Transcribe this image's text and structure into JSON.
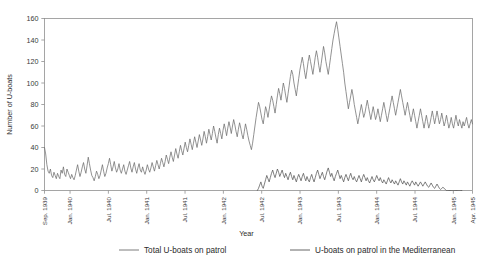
{
  "chart_data": {
    "type": "line",
    "title": "",
    "xlabel": "Year",
    "ylabel": "Number of U-boats",
    "ylim": [
      0,
      160
    ],
    "ytick_values": [
      0,
      20,
      40,
      60,
      80,
      100,
      120,
      140,
      160
    ],
    "grid": false,
    "legend_position": "bottom",
    "xtick_labels": [
      "Sep. 1939",
      "Jan. 1940",
      "Jul. 1940",
      "Jan. 1941",
      "Jul. 1941",
      "Jan. 1942",
      "Jul. 1942",
      "Jan. 1943",
      "Jul. 1943",
      "Jan. 1944",
      "Jul. 1944",
      "Jan. 1945",
      "Apr. 1945"
    ],
    "xtick_months": [
      0,
      4,
      10,
      16,
      22,
      28,
      34,
      40,
      46,
      52,
      58,
      64,
      67
    ],
    "x_start_label": "Sep. 1939",
    "x_end_label": "Apr. 1945",
    "series": [
      {
        "name": "Total U-boats on patrol",
        "color": "#6e6e6e",
        "values": [
          40,
          34,
          24,
          18,
          16,
          20,
          14,
          12,
          17,
          14,
          11,
          16,
          13,
          11,
          19,
          16,
          22,
          15,
          13,
          20,
          17,
          14,
          11,
          15,
          12,
          10,
          14,
          19,
          24,
          18,
          13,
          17,
          22,
          26,
          20,
          16,
          23,
          31,
          25,
          19,
          14,
          12,
          9,
          13,
          18,
          15,
          11,
          14,
          19,
          24,
          18,
          13,
          16,
          21,
          25,
          30,
          24,
          18,
          22,
          27,
          21,
          17,
          20,
          25,
          19,
          16,
          20,
          24,
          18,
          15,
          19,
          23,
          27,
          21,
          17,
          22,
          26,
          20,
          16,
          21,
          25,
          19,
          17,
          22,
          18,
          15,
          19,
          24,
          20,
          17,
          21,
          26,
          22,
          18,
          23,
          28,
          24,
          20,
          25,
          30,
          26,
          22,
          27,
          33,
          29,
          25,
          31,
          36,
          31,
          27,
          33,
          39,
          34,
          30,
          36,
          42,
          37,
          33,
          39,
          45,
          40,
          36,
          42,
          48,
          43,
          38,
          44,
          50,
          45,
          40,
          46,
          52,
          47,
          42,
          48,
          55,
          50,
          44,
          50,
          57,
          52,
          47,
          53,
          60,
          55,
          49,
          44,
          52,
          58,
          53,
          48,
          56,
          62,
          57,
          51,
          58,
          64,
          59,
          53,
          60,
          66,
          61,
          55,
          50,
          57,
          63,
          58,
          52,
          48,
          55,
          62,
          57,
          51,
          46,
          42,
          38,
          44,
          52,
          60,
          68,
          75,
          82,
          78,
          72,
          66,
          62,
          70,
          78,
          74,
          68,
          75,
          82,
          88,
          84,
          78,
          72,
          80,
          88,
          95,
          90,
          84,
          92,
          100,
          95,
          88,
          82,
          90,
          98,
          106,
          112,
          108,
          100,
          94,
          88,
          96,
          104,
          112,
          118,
          124,
          118,
          110,
          104,
          112,
          120,
          126,
          120,
          114,
          108,
          116,
          124,
          130,
          124,
          116,
          110,
          118,
          126,
          134,
          128,
          120,
          114,
          108,
          116,
          124,
          132,
          140,
          146,
          152,
          157,
          150,
          142,
          134,
          126,
          118,
          110,
          100,
          92,
          84,
          76,
          82,
          88,
          94,
          88,
          80,
          74,
          68,
          62,
          68,
          74,
          80,
          74,
          68,
          72,
          78,
          84,
          78,
          72,
          66,
          72,
          78,
          72,
          66,
          70,
          76,
          70,
          64,
          70,
          76,
          82,
          76,
          70,
          64,
          70,
          76,
          82,
          88,
          82,
          76,
          70,
          76,
          82,
          88,
          94,
          88,
          82,
          76,
          70,
          76,
          82,
          76,
          70,
          64,
          70,
          76,
          70,
          64,
          58,
          64,
          70,
          76,
          70,
          64,
          58,
          64,
          70,
          64,
          58,
          62,
          68,
          74,
          68,
          62,
          68,
          74,
          68,
          62,
          66,
          72,
          66,
          60,
          64,
          70,
          64,
          58,
          62,
          68,
          62,
          58,
          64,
          70,
          64,
          60,
          66,
          62,
          58,
          64,
          60,
          64,
          68,
          62,
          58,
          62,
          66,
          62
        ]
      },
      {
        "name": "U-boats on patrol in the Mediterranean",
        "color": "#555555",
        "start_index": 180,
        "values": [
          0,
          2,
          5,
          8,
          4,
          2,
          6,
          10,
          14,
          11,
          8,
          12,
          16,
          19,
          15,
          12,
          16,
          20,
          17,
          13,
          16,
          19,
          15,
          12,
          16,
          13,
          10,
          14,
          17,
          13,
          10,
          14,
          11,
          8,
          12,
          15,
          12,
          9,
          13,
          16,
          12,
          9,
          13,
          10,
          8,
          12,
          15,
          11,
          8,
          12,
          16,
          19,
          15,
          11,
          14,
          17,
          13,
          10,
          14,
          18,
          21,
          17,
          13,
          16,
          12,
          9,
          13,
          16,
          19,
          15,
          11,
          14,
          11,
          8,
          12,
          15,
          12,
          9,
          13,
          16,
          12,
          10,
          13,
          10,
          8,
          11,
          14,
          11,
          8,
          12,
          15,
          12,
          9,
          12,
          9,
          7,
          10,
          13,
          10,
          8,
          11,
          14,
          11,
          9,
          12,
          9,
          7,
          10,
          8,
          6,
          9,
          12,
          9,
          7,
          10,
          8,
          6,
          9,
          7,
          5,
          8,
          11,
          8,
          6,
          9,
          7,
          5,
          8,
          6,
          4,
          7,
          9,
          7,
          5,
          8,
          6,
          4,
          6,
          8,
          6,
          4,
          6,
          8,
          6,
          4,
          3,
          5,
          7,
          5,
          3,
          2,
          4,
          6,
          4,
          2,
          1,
          2,
          3,
          2,
          1,
          0,
          0,
          0,
          0,
          0,
          0,
          0,
          0,
          0,
          0,
          0,
          0,
          0,
          0
        ]
      }
    ]
  },
  "legend": {
    "items": [
      {
        "label": "Total U-boats on patrol"
      },
      {
        "label": "U-boats on patrol in the Mediterranean"
      }
    ]
  }
}
